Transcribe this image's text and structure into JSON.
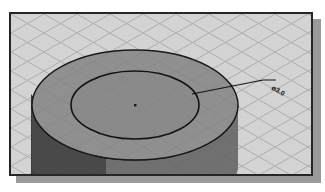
{
  "image": {
    "kind": "cad-isometric-illustration",
    "title": "Isometric shaded cylinder with diameter dimension",
    "width": 325,
    "height": 192
  },
  "canvas": {
    "background_color": "#ffffff",
    "frame": {
      "border_color": "#262626",
      "fill_color": "#d2d2d2",
      "shadow_color": "#9a9a9a",
      "x": 9,
      "y": 12,
      "width": 304,
      "height": 164
    }
  },
  "grid": {
    "name": "isometric-snap-grid",
    "line_color": "#a8a8a8",
    "cell_width": 33,
    "cell_height": 19,
    "angle_deg": 30,
    "visible": true
  },
  "model": {
    "shape": "cylinder",
    "top_face": {
      "name": "cylinder-top-face",
      "fill_color": "#7d7d7d",
      "edge_color": "#1a1a1a",
      "center_x": 133,
      "center_y": 103,
      "radius_x": 103,
      "radius_y": 55
    },
    "inner_circle": {
      "name": "cylinder-inner-circle",
      "edge_color": "#111111",
      "center_x": 133,
      "center_y": 103,
      "radius_x": 64,
      "radius_y": 34
    },
    "body": {
      "name": "cylinder-side-wall",
      "fill_color": "#6a6a6a",
      "height": 60
    },
    "shadow_region": {
      "name": "cast-shadow",
      "fill_color": "#2b2b2b"
    },
    "center_point": {
      "name": "center-point-marker",
      "x": 133,
      "y": 103,
      "color": "#1a1a1a",
      "size": 2
    }
  },
  "annotation": {
    "leader": {
      "name": "diameter-leader-line",
      "color": "#101010",
      "stroke_width": 1,
      "points": "190,92 261,78 274,78"
    },
    "dimension_label": {
      "name": "diameter-dimension-text",
      "text": "ø3.0",
      "symbol": "ø",
      "value": "3.0",
      "color": "#141414",
      "x": 272,
      "y": 84,
      "rotation_deg": 30
    }
  }
}
